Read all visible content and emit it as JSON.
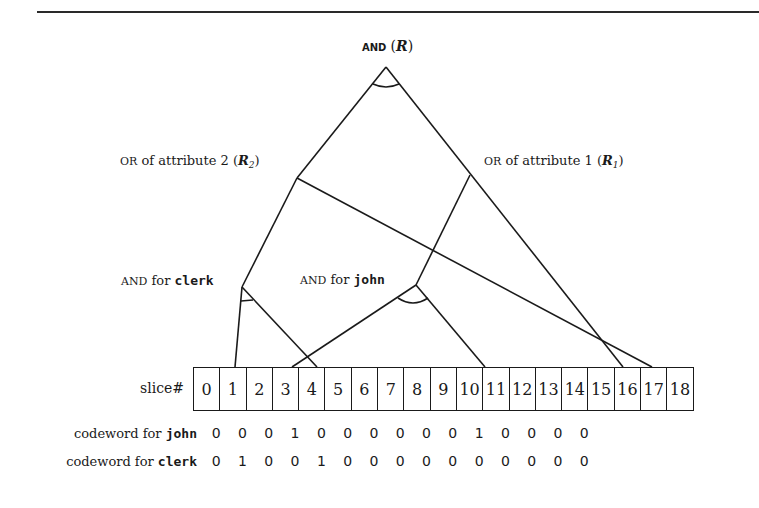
{
  "diagram": {
    "nodes": {
      "root": {
        "op": "AND",
        "name": "(",
        "var": "R",
        "close": ")"
      },
      "r2": {
        "op": "OR",
        "text": " of attribute 2 (",
        "var": "R",
        "sub": "2",
        "close": ")"
      },
      "r1": {
        "op": "OR",
        "text": " of attribute 1 (",
        "var": "R",
        "sub": "1",
        "close": ")"
      },
      "clerk": {
        "op": "AND",
        "text": " for ",
        "term": "clerk"
      },
      "john": {
        "op": "AND",
        "text": " for ",
        "term": "john"
      }
    },
    "slice_label": "slice#",
    "slices": [
      "0",
      "1",
      "2",
      "3",
      "4",
      "5",
      "6",
      "7",
      "8",
      "9",
      "10",
      "11",
      "12",
      "13",
      "14",
      "15",
      "16",
      "17",
      "18"
    ],
    "codewords": [
      {
        "label_prefix": "codeword for ",
        "term": "john",
        "bits": [
          "0",
          "0",
          "0",
          "1",
          "0",
          "0",
          "0",
          "0",
          "0",
          "0",
          "1",
          "0",
          "0",
          "0",
          "0"
        ]
      },
      {
        "label_prefix": "codeword for ",
        "term": "clerk",
        "bits": [
          "0",
          "1",
          "0",
          "0",
          "1",
          "0",
          "0",
          "0",
          "0",
          "0",
          "0",
          "0",
          "0",
          "0",
          "0"
        ]
      }
    ],
    "edges": [
      {
        "from": "root",
        "to": "r2"
      },
      {
        "from": "root",
        "to": "r1"
      },
      {
        "from": "r2",
        "to": "clerk"
      },
      {
        "from": "r2",
        "to": "slice-16"
      },
      {
        "from": "r1",
        "to": "john"
      },
      {
        "from": "r1",
        "to": "slice-15"
      },
      {
        "from": "clerk",
        "to": "slice-1"
      },
      {
        "from": "clerk",
        "to": "slice-4"
      },
      {
        "from": "john",
        "to": "slice-3"
      },
      {
        "from": "john",
        "to": "slice-10"
      }
    ]
  }
}
